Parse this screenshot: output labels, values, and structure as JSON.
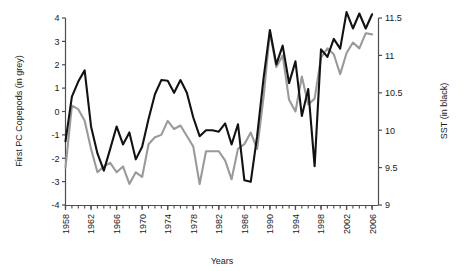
{
  "chart_data": {
    "type": "line",
    "title": "",
    "xlabel": "Years",
    "ylabel": "First PC Copepods (in grey)",
    "y2label": "SST (in black)",
    "xlim": [
      1958,
      2007
    ],
    "ylim": [
      -4,
      4
    ],
    "y2lim": [
      9,
      11.5
    ],
    "grid": false,
    "legend_position": "none",
    "y_ticks": [
      "4",
      "3",
      "2",
      "1",
      "0",
      "-1",
      "-2",
      "-3",
      "-4"
    ],
    "y_tick_values": [
      4,
      3,
      2,
      1,
      0,
      -1,
      -2,
      -3,
      -4
    ],
    "y2_ticks": [
      "11.5",
      "11",
      "10.5",
      "10",
      "9.5",
      "9"
    ],
    "y2_tick_values": [
      11.5,
      11,
      10.5,
      10,
      9.5,
      9
    ],
    "x_ticks": [
      "1958",
      "1962",
      "1966",
      "1970",
      "1974",
      "1978",
      "1982",
      "1986",
      "1990",
      "1994",
      "1998",
      "2002",
      "2006"
    ],
    "x_tick_values": [
      1958,
      1962,
      1966,
      1970,
      1974,
      1978,
      1982,
      1986,
      1990,
      1994,
      1998,
      2002,
      2006
    ],
    "x_minor_tick_step": 1,
    "x": [
      1958,
      1959,
      1960,
      1961,
      1962,
      1963,
      1964,
      1965,
      1966,
      1967,
      1968,
      1969,
      1970,
      1971,
      1972,
      1973,
      1974,
      1975,
      1976,
      1977,
      1978,
      1979,
      1980,
      1981,
      1982,
      1983,
      1984,
      1985,
      1986,
      1987,
      1988,
      1989,
      1990,
      1991,
      1992,
      1993,
      1994,
      1995,
      1996,
      1997,
      1998,
      1999,
      2000,
      2001,
      2002,
      2003,
      2004,
      2005,
      2006
    ],
    "series": [
      {
        "name": "First PC Copepods (in grey)",
        "axis": "left",
        "color": "#9a9a9a",
        "units": "PC score",
        "values": [
          -2.4,
          0.25,
          0.1,
          -0.4,
          -1.6,
          -2.6,
          -2.35,
          -2.2,
          -2.6,
          -2.35,
          -3.1,
          -2.6,
          -2.8,
          -1.4,
          -1.1,
          -1.0,
          -0.4,
          -0.75,
          -0.6,
          -1.05,
          -1.5,
          -3.1,
          -1.7,
          -1.7,
          -1.7,
          -2.1,
          -2.9,
          -1.6,
          -1.4,
          -0.9,
          -1.6,
          0.6,
          3.4,
          1.9,
          2.4,
          0.5,
          0.0,
          1.5,
          0.3,
          0.55,
          2.3,
          2.7,
          2.45,
          1.6,
          2.5,
          2.95,
          2.7,
          3.35,
          3.3
        ]
      },
      {
        "name": "SST (in black)",
        "axis": "right",
        "color": "#121212",
        "units": "°C",
        "values_left_scale": [
          -2.3,
          -0.35,
          0.1,
          0.55,
          -1.45,
          -2.6,
          -3.35,
          -2.45,
          -1.6,
          -2.2,
          -1.7,
          -2.85,
          -2.3,
          -1.1,
          -0.05,
          0.55,
          0.5,
          0.0,
          0.55,
          0.0,
          -1.05,
          -1.85,
          -1.6,
          -1.6,
          -1.65,
          -1.3,
          -2.2,
          -1.35,
          -3.75,
          -3.8,
          -1.85,
          0.6,
          2.7,
          1.2,
          2.0,
          0.4,
          1.35,
          -1.0,
          0.15,
          -3.15,
          1.85,
          1.55,
          2.3,
          1.9,
          3.45,
          2.75,
          3.4,
          2.75,
          3.35
        ],
        "values": [
          9.85,
          10.45,
          10.65,
          10.8,
          10.05,
          9.69,
          9.46,
          9.75,
          10.05,
          9.81,
          9.97,
          9.61,
          9.78,
          10.15,
          10.48,
          10.67,
          10.66,
          10.5,
          10.67,
          10.5,
          10.17,
          9.92,
          10.0,
          10.0,
          9.98,
          10.09,
          9.81,
          10.08,
          9.33,
          9.31,
          9.92,
          10.69,
          11.34,
          10.88,
          11.13,
          10.63,
          10.92,
          10.19,
          10.55,
          9.52,
          11.08,
          10.98,
          11.22,
          11.09,
          11.58,
          11.36,
          11.56,
          11.36,
          11.55
        ]
      }
    ]
  },
  "axes": {
    "x_axis_title": "Years",
    "y_left_title": "First PC Copepods (in grey)",
    "y_right_title": "SST (in black)"
  }
}
